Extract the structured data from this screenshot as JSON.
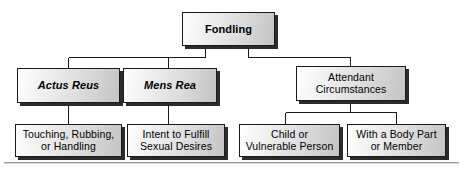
{
  "diagram": {
    "title": "Fondling",
    "type": "hierarchy-tree",
    "orientation": "top-down",
    "levels": 3,
    "colors": {
      "box_fill_light": "#ffffff",
      "box_fill_dark": "#c4c4c4",
      "box_border": "#1a1a1a",
      "box_shadow": "#2b2b2b",
      "line": "#1a1a1a",
      "text": "#000000",
      "background": "#ffffff",
      "rule": "#9a9a9a"
    },
    "nodes": {
      "root": {
        "label": "Fondling",
        "style": "bold",
        "level": 1
      },
      "actus_reus": {
        "label": "Actus Reus",
        "style": "bold-italic",
        "level": 2
      },
      "mens_rea": {
        "label": "Mens Rea",
        "style": "bold-italic",
        "level": 2
      },
      "attendant_circumstances": {
        "label": "Attendant\nCircumstances",
        "style": "regular",
        "level": 2
      },
      "touching": {
        "label": "Touching, Rubbing,\nor Handling",
        "style": "regular",
        "level": 3
      },
      "intent": {
        "label": "Intent to Fulfill\nSexual Desires",
        "style": "regular",
        "level": 3
      },
      "child": {
        "label": "Child or\nVulnerable Person",
        "style": "regular",
        "level": 3
      },
      "body_part": {
        "label": "With a Body Part\nor Member",
        "style": "regular",
        "level": 3
      }
    },
    "edges": [
      {
        "from": "root",
        "to": "actus_reus"
      },
      {
        "from": "root",
        "to": "mens_rea"
      },
      {
        "from": "root",
        "to": "attendant_circumstances"
      },
      {
        "from": "actus_reus",
        "to": "touching"
      },
      {
        "from": "mens_rea",
        "to": "intent"
      },
      {
        "from": "attendant_circumstances",
        "to": "child"
      },
      {
        "from": "attendant_circumstances",
        "to": "body_part"
      }
    ]
  }
}
